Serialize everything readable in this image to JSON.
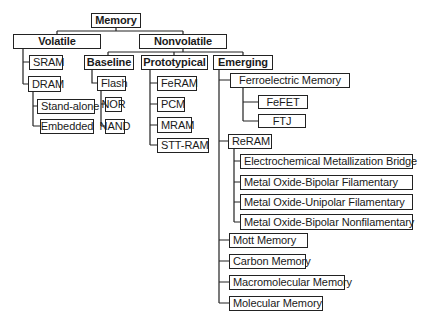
{
  "diagram": {
    "title": "Memory",
    "nodes": [
      {
        "id": "memory",
        "label": "Memory",
        "x": 91,
        "y": 13,
        "w": 50,
        "h": 15,
        "bold": true
      },
      {
        "id": "volatile",
        "label": "Volatile",
        "x": 13,
        "y": 34,
        "w": 88,
        "h": 15,
        "bold": true
      },
      {
        "id": "nonvolatile",
        "label": "Nonvolatile",
        "x": 139,
        "y": 34,
        "w": 88,
        "h": 15,
        "bold": true
      },
      {
        "id": "sram",
        "label": "SRAM",
        "x": 29,
        "y": 55,
        "w": 34,
        "h": 15
      },
      {
        "id": "dram",
        "label": "DRAM",
        "x": 28,
        "y": 76,
        "w": 33,
        "h": 16
      },
      {
        "id": "stand-alone",
        "label": "Stand-alone",
        "x": 37,
        "y": 99,
        "w": 58,
        "h": 15
      },
      {
        "id": "embedded",
        "label": "Embedded",
        "x": 40,
        "y": 119,
        "w": 54,
        "h": 15,
        "center": true
      },
      {
        "id": "baseline",
        "label": "Baseline",
        "x": 84,
        "y": 55,
        "w": 50,
        "h": 15,
        "bold": true
      },
      {
        "id": "flash",
        "label": "Flash",
        "x": 97,
        "y": 76,
        "w": 29,
        "h": 15
      },
      {
        "id": "nor",
        "label": "NOR",
        "x": 105,
        "y": 97,
        "w": 17,
        "h": 15,
        "center": true
      },
      {
        "id": "nand",
        "label": "NAND",
        "x": 105,
        "y": 119,
        "w": 20,
        "h": 15,
        "center": true
      },
      {
        "id": "prototypical",
        "label": "Prototypical",
        "x": 141,
        "y": 55,
        "w": 67,
        "h": 15,
        "bold": true
      },
      {
        "id": "feram",
        "label": "FeRAM",
        "x": 157,
        "y": 76,
        "w": 40,
        "h": 15
      },
      {
        "id": "pcm",
        "label": "PCM",
        "x": 157,
        "y": 97,
        "w": 28,
        "h": 15
      },
      {
        "id": "mram",
        "label": "MRAM",
        "x": 157,
        "y": 117,
        "w": 35,
        "h": 16
      },
      {
        "id": "stt-ram",
        "label": "STT-RAM",
        "x": 157,
        "y": 138,
        "w": 52,
        "h": 15
      },
      {
        "id": "emerging",
        "label": "Emerging",
        "x": 213,
        "y": 55,
        "w": 60,
        "h": 15,
        "bold": true
      },
      {
        "id": "ferroelectric",
        "label": "Ferroelectric Memory",
        "x": 230,
        "y": 73,
        "w": 120,
        "h": 15,
        "center": true
      },
      {
        "id": "fefet",
        "label": "FeFET",
        "x": 258,
        "y": 95,
        "w": 50,
        "h": 14,
        "center": true
      },
      {
        "id": "ftj",
        "label": "FTJ",
        "x": 258,
        "y": 114,
        "w": 48,
        "h": 14,
        "center": true
      },
      {
        "id": "reram",
        "label": "ReRAM",
        "x": 228,
        "y": 134,
        "w": 44,
        "h": 15
      },
      {
        "id": "ecm",
        "label": "Electrochemical Metallization Bridge",
        "x": 240,
        "y": 154,
        "w": 173,
        "h": 15
      },
      {
        "id": "mo-bf",
        "label": "Metal Oxide-Bipolar Filamentary",
        "x": 240,
        "y": 175,
        "w": 173,
        "h": 15
      },
      {
        "id": "mo-uf",
        "label": "Metal Oxide-Unipolar Filamentary",
        "x": 240,
        "y": 194,
        "w": 173,
        "h": 16
      },
      {
        "id": "mo-bnf",
        "label": "Metal Oxide-Bipolar Nonfilamentary",
        "x": 240,
        "y": 214,
        "w": 173,
        "h": 16
      },
      {
        "id": "mott",
        "label": "Mott Memory",
        "x": 229,
        "y": 233,
        "w": 79,
        "h": 15
      },
      {
        "id": "carbon",
        "label": "Carbon Memory",
        "x": 229,
        "y": 254,
        "w": 77,
        "h": 15
      },
      {
        "id": "macromolecular",
        "label": "Macromolecular Memory",
        "x": 229,
        "y": 275,
        "w": 116,
        "h": 15
      },
      {
        "id": "molecular",
        "label": "Molecular Memory",
        "x": 229,
        "y": 296,
        "w": 94,
        "h": 15
      }
    ],
    "edges": [
      [
        "memory",
        "volatile"
      ],
      [
        "memory",
        "nonvolatile"
      ],
      [
        "volatile",
        "sram"
      ],
      [
        "volatile",
        "dram"
      ],
      [
        "dram",
        "stand-alone"
      ],
      [
        "dram",
        "embedded"
      ],
      [
        "nonvolatile",
        "baseline"
      ],
      [
        "nonvolatile",
        "prototypical"
      ],
      [
        "nonvolatile",
        "emerging"
      ],
      [
        "baseline",
        "flash"
      ],
      [
        "flash",
        "nor"
      ],
      [
        "flash",
        "nand"
      ],
      [
        "prototypical",
        "feram"
      ],
      [
        "prototypical",
        "pcm"
      ],
      [
        "prototypical",
        "mram"
      ],
      [
        "prototypical",
        "stt-ram"
      ],
      [
        "emerging",
        "ferroelectric"
      ],
      [
        "ferroelectric",
        "fefet"
      ],
      [
        "ferroelectric",
        "ftj"
      ],
      [
        "emerging",
        "reram"
      ],
      [
        "reram",
        "ecm"
      ],
      [
        "reram",
        "mo-bf"
      ],
      [
        "reram",
        "mo-uf"
      ],
      [
        "reram",
        "mo-bnf"
      ],
      [
        "emerging",
        "mott"
      ],
      [
        "emerging",
        "carbon"
      ],
      [
        "emerging",
        "macromolecular"
      ],
      [
        "emerging",
        "molecular"
      ]
    ],
    "line_color": "#222222"
  }
}
